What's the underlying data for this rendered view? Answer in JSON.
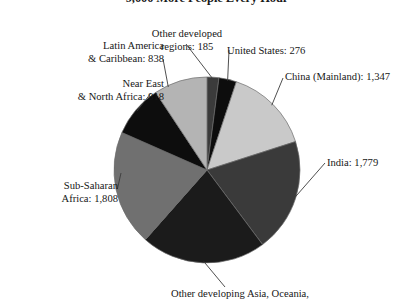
{
  "chart_data": {
    "type": "pie",
    "title": "9,000 More People Every Hour",
    "xlabel": "",
    "ylabel": "",
    "legend_position": "callout-labels",
    "grid": false,
    "unit_note": "",
    "categories": [
      "Other developed regions",
      "United States",
      "China (Mainland)",
      "India",
      "Other developing Asia, Oceania,",
      "Sub-Saharan Africa",
      "Near East & North Africa",
      "Latin America & Caribbean"
    ],
    "values": [
      185,
      276,
      1347,
      1779,
      1956,
      1808,
      818,
      838
    ],
    "total": 9007,
    "slices": [
      {
        "label_line1": "Other developed",
        "label_line2": "regions: 185",
        "name": "Other developed regions",
        "value": 185,
        "color": "#3b3b3b",
        "start_deg": 0.0,
        "end_deg": 7.4
      },
      {
        "label_line1": "United States: 276",
        "label_line2": "",
        "name": "United States",
        "value": 276,
        "color": "#0d0d0d",
        "start_deg": 7.4,
        "end_deg": 18.4
      },
      {
        "label_line1": "China (Mainland): 1,347",
        "label_line2": "",
        "name": "China (Mainland)",
        "value": 1347,
        "color": "#c9c9c9",
        "start_deg": 18.4,
        "end_deg": 72.2
      },
      {
        "label_line1": "India: 1,779",
        "label_line2": "",
        "name": "India",
        "value": 1779,
        "color": "#3a3a3a",
        "start_deg": 72.2,
        "end_deg": 143.3
      },
      {
        "label_line1": "Other developing Asia, Oceania,",
        "label_line2": "",
        "name": "Other developing Asia Oceania",
        "value": 1956,
        "color": "#1b1b1b",
        "start_deg": 143.3,
        "end_deg": 221.5
      },
      {
        "label_line1": "Sub-Saharan",
        "label_line2": "Africa: 1,808",
        "name": "Sub-Saharan Africa",
        "value": 1808,
        "color": "#707070",
        "start_deg": 221.5,
        "end_deg": 293.8
      },
      {
        "label_line1": "Near East",
        "label_line2": "& North Africa: 818",
        "name": "Near East & North Africa",
        "value": 818,
        "color": "#0d0d0d",
        "start_deg": 293.8,
        "end_deg": 326.5
      },
      {
        "label_line1": "Latin America",
        "label_line2": "& Caribbean: 838",
        "name": "Latin America & Caribbean",
        "value": 838,
        "color": "#b4b4b4",
        "start_deg": 326.5,
        "end_deg": 360.0
      }
    ],
    "geometry": {
      "cx": 207,
      "cy": 170,
      "r": 93
    },
    "colors": {
      "light_gray": "#c9c9c9",
      "pale_gray": "#b4b4b4",
      "mid_gray": "#707070",
      "dark_gray": "#3a3a3a",
      "near_black": "#1b1b1b",
      "black": "#0d0d0d",
      "outline": "#6b6b6b",
      "text": "#171717"
    }
  }
}
